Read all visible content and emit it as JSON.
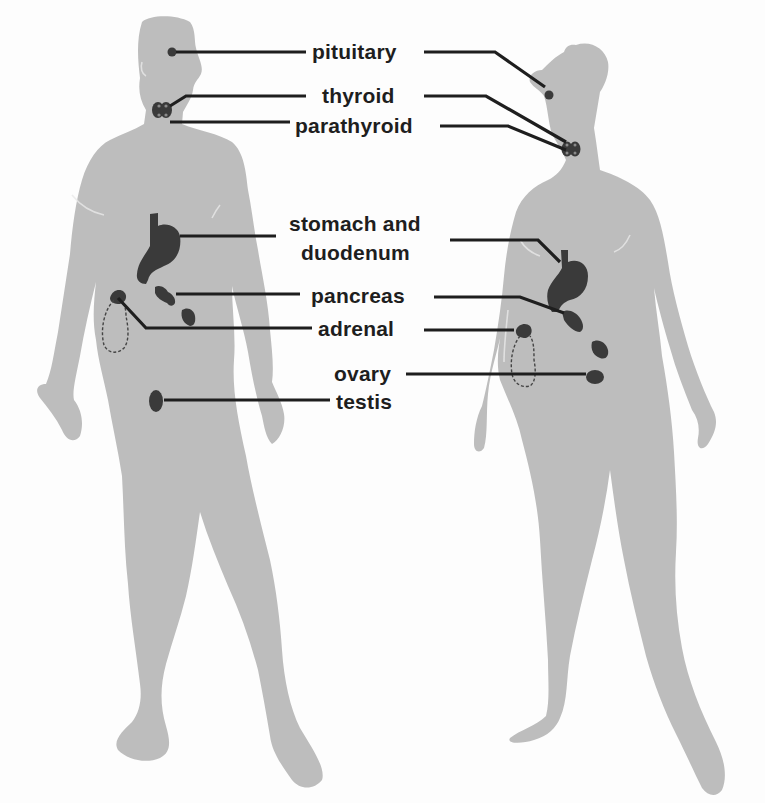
{
  "diagram": {
    "type": "endocrine-system-illustration",
    "figures": [
      {
        "id": "male",
        "label": "male body silhouette"
      },
      {
        "id": "female",
        "label": "female body silhouette"
      }
    ],
    "colors": {
      "body": "#bdbdbd",
      "organ": "#3a3a3a",
      "leader": "#1e1e1e",
      "text": "#1e1e1e",
      "background": "#fdfdfd"
    }
  },
  "labels": {
    "pituitary": "pituitary",
    "thyroid": "thyroid",
    "parathyroid": "parathyroid",
    "stomach_line1": "stomach and",
    "stomach_line2": "duodenum",
    "pancreas": "pancreas",
    "adrenal": "adrenal",
    "ovary": "ovary",
    "testis": "testis"
  },
  "male_organs": [
    "pituitary",
    "thyroid",
    "parathyroid",
    "stomach and duodenum",
    "pancreas",
    "adrenal",
    "testis"
  ],
  "female_organs": [
    "pituitary",
    "thyroid",
    "parathyroid",
    "stomach and duodenum",
    "pancreas",
    "adrenal",
    "ovary"
  ]
}
